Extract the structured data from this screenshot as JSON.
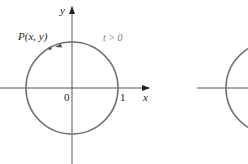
{
  "figure_left": {
    "axis_x_label": "x",
    "axis_y_label": "y",
    "origin_label": "0",
    "unit_label": "1",
    "point_label": "P(x, y)",
    "condition_label": "t > 0",
    "direction": "counterclockwise"
  },
  "figure_right": {
    "partially_visible": true
  },
  "colors": {
    "axis": "#555555",
    "circle": "#6e6e6e",
    "text": "#222222"
  }
}
